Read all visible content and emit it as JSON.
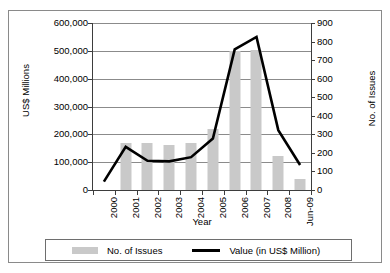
{
  "chart_data": {
    "type": "bar",
    "title": "",
    "xlabel": "Year",
    "categories": [
      "2000",
      "2001",
      "2002",
      "2003",
      "2004",
      "2005",
      "2006",
      "2007",
      "2008",
      "Jun-09"
    ],
    "series": [
      {
        "name": "No. of Issues",
        "type": "bar",
        "axis": "right",
        "values": [
          0,
          252,
          252,
          245,
          253,
          330,
          748,
          752,
          185,
          62
        ],
        "color": "#c9c9c9"
      },
      {
        "name": "Value (in US$ Million)",
        "type": "line",
        "axis": "left",
        "values": [
          30000,
          155000,
          105000,
          103000,
          118000,
          185000,
          505000,
          550000,
          215000,
          90000
        ],
        "color": "#000000"
      }
    ],
    "left_axis": {
      "label": "US$ Millions",
      "ticks": [
        "0",
        "100,000",
        "200,000",
        "300,000",
        "400,000",
        "500,000",
        "600,000"
      ],
      "min": 0,
      "max": 600000,
      "step": 100000
    },
    "right_axis": {
      "label": "No. of Issues",
      "ticks": [
        "0",
        "100",
        "200",
        "300",
        "400",
        "500",
        "600",
        "700",
        "800",
        "900"
      ],
      "min": 0,
      "max": 900,
      "step": 100
    },
    "grid": true,
    "legend_position": "bottom",
    "legend": [
      {
        "label": "No. of Issues",
        "marker": "bar-swatch",
        "color": "#c9c9c9"
      },
      {
        "label": "Value (in US$ Million)",
        "marker": "line-swatch",
        "color": "#000000"
      }
    ]
  }
}
